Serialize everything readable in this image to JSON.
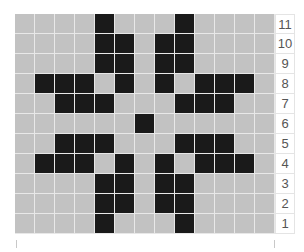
{
  "chart_data": {
    "type": "heatmap",
    "title": "",
    "columns": 13,
    "rows": [
      {
        "label": "11",
        "filled": [
          5,
          9
        ]
      },
      {
        "label": "10",
        "filled": [
          5,
          6,
          8,
          9
        ]
      },
      {
        "label": "9",
        "filled": [
          5,
          6,
          8,
          9
        ]
      },
      {
        "label": "8",
        "filled": [
          2,
          3,
          4,
          6,
          8,
          10,
          11,
          12
        ]
      },
      {
        "label": "7",
        "filled": [
          3,
          4,
          5,
          9,
          10,
          11
        ]
      },
      {
        "label": "6",
        "filled": [
          7
        ]
      },
      {
        "label": "5",
        "filled": [
          3,
          4,
          5,
          9,
          10,
          11
        ]
      },
      {
        "label": "4",
        "filled": [
          2,
          3,
          4,
          6,
          8,
          10,
          11,
          12
        ]
      },
      {
        "label": "3",
        "filled": [
          5,
          6,
          8,
          9
        ]
      },
      {
        "label": "2",
        "filled": [
          5,
          6,
          8,
          9
        ]
      },
      {
        "label": "1",
        "filled": [
          5,
          9
        ]
      }
    ],
    "colors": {
      "filled": "#1a1a1a",
      "empty": "#c2c2c2"
    }
  }
}
